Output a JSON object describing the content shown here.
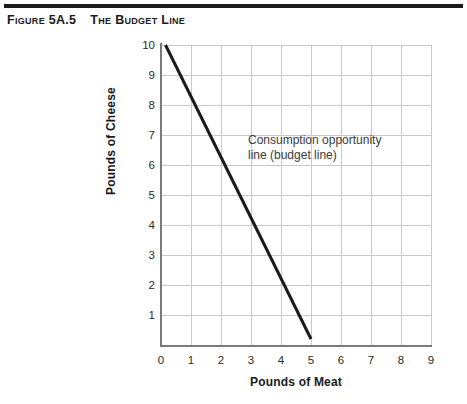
{
  "figure": {
    "number": "Figure 5A.5",
    "title": "The Budget Line"
  },
  "chart_data": {
    "type": "line",
    "title": "The Budget Line",
    "xlabel": "Pounds of Meat",
    "ylabel": "Pounds of Cheese",
    "xlim": [
      0,
      9
    ],
    "ylim": [
      0,
      10
    ],
    "x_ticks": [
      "0",
      "1",
      "2",
      "3",
      "4",
      "5",
      "6",
      "7",
      "8",
      "9"
    ],
    "y_ticks": [
      "1",
      "2",
      "3",
      "4",
      "5",
      "6",
      "7",
      "8",
      "9",
      "10"
    ],
    "grid": true,
    "legend": "none",
    "series": [
      {
        "name": "Consumption opportunity line (budget line)",
        "x": [
          0.15,
          5.0
        ],
        "y": [
          10.0,
          0.2
        ],
        "color": "#1a1a1a",
        "slope": -2
      }
    ],
    "annotations": [
      {
        "text": "Consumption opportunity\nline (budget line)",
        "x": 3.0,
        "y": 6.4
      }
    ]
  },
  "colors": {
    "line": "#1a1a1a",
    "grid": "#c9c9c9",
    "axis": "#7a7a7a",
    "text": "#1a1a1a",
    "annotation_text": "#3a3a3a",
    "rule": "#1a1a1a"
  }
}
